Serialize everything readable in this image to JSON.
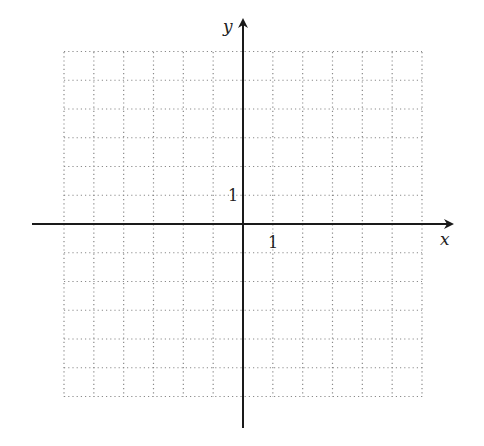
{
  "chart_data": {
    "type": "coordinate-grid",
    "title": "",
    "xlabel": "x",
    "ylabel": "y",
    "xlim": [
      -6,
      6
    ],
    "ylim": [
      -6,
      6
    ],
    "grid": true,
    "grid_style": "dotted",
    "tick_labels": {
      "x": "1",
      "y": "1"
    },
    "series": []
  },
  "axes": {
    "x_label": "x",
    "y_label": "y",
    "x_unit_label": "1",
    "y_unit_label": "1"
  },
  "colors": {
    "axis": "#1a1a1a",
    "grid": "#8a8a8a",
    "text": "#222222"
  }
}
